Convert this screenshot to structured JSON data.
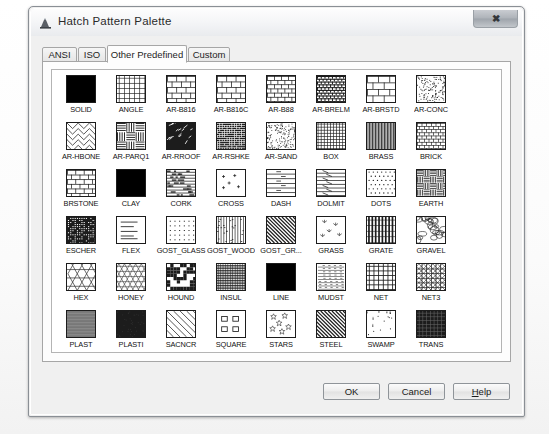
{
  "window": {
    "title": "Hatch Pattern Palette",
    "icon": "autocad-hatch-icon",
    "close_label": "✖"
  },
  "tabs": [
    {
      "label": "ANSI",
      "selected": false
    },
    {
      "label": "ISO",
      "selected": false
    },
    {
      "label": "Other Predefined",
      "selected": true
    },
    {
      "label": "Custom",
      "selected": false
    }
  ],
  "patterns": [
    {
      "label": "SOLID",
      "fill": "solid"
    },
    {
      "label": "ANGLE",
      "fill": "angle"
    },
    {
      "label": "AR-B816",
      "fill": "brick-lg"
    },
    {
      "label": "AR-B816C",
      "fill": "brick-lg"
    },
    {
      "label": "AR-B88",
      "fill": "brick-sm"
    },
    {
      "label": "AR-BRELM",
      "fill": "brick-dense-dark"
    },
    {
      "label": "AR-BRSTD",
      "fill": "brick-wide"
    },
    {
      "label": "AR-CONC",
      "fill": "concrete"
    },
    {
      "label": "AR-HBONE",
      "fill": "herringbone"
    },
    {
      "label": "AR-PARQ1",
      "fill": "parquet"
    },
    {
      "label": "AR-RROOF",
      "fill": "rroof"
    },
    {
      "label": "AR-RSHKE",
      "fill": "rshake"
    },
    {
      "label": "AR-SAND",
      "fill": "sand"
    },
    {
      "label": "BOX",
      "fill": "box"
    },
    {
      "label": "BRASS",
      "fill": "brass"
    },
    {
      "label": "BRICK",
      "fill": "brick-tiny"
    },
    {
      "label": "BRSTONE",
      "fill": "brick-stone"
    },
    {
      "label": "CLAY",
      "fill": "solid"
    },
    {
      "label": "CORK",
      "fill": "cork"
    },
    {
      "label": "CROSS",
      "fill": "cross"
    },
    {
      "label": "DASH",
      "fill": "dash"
    },
    {
      "label": "DOLMIT",
      "fill": "dolmit"
    },
    {
      "label": "DOTS",
      "fill": "dots"
    },
    {
      "label": "EARTH",
      "fill": "earth"
    },
    {
      "label": "ESCHER",
      "fill": "escher"
    },
    {
      "label": "FLEX",
      "fill": "flex"
    },
    {
      "label": "GOST_GLASS",
      "fill": "gost-glass"
    },
    {
      "label": "GOST_WOOD",
      "fill": "gost-wood"
    },
    {
      "label": "GOST_GR...",
      "fill": "diag45"
    },
    {
      "label": "GRASS",
      "fill": "grass"
    },
    {
      "label": "GRATE",
      "fill": "grate"
    },
    {
      "label": "GRAVEL",
      "fill": "gravel"
    },
    {
      "label": "HEX",
      "fill": "hex"
    },
    {
      "label": "HONEY",
      "fill": "honey"
    },
    {
      "label": "HOUND",
      "fill": "hound"
    },
    {
      "label": "INSUL",
      "fill": "insul"
    },
    {
      "label": "LINE",
      "fill": "solid"
    },
    {
      "label": "MUDST",
      "fill": "mudst"
    },
    {
      "label": "NET",
      "fill": "net"
    },
    {
      "label": "NET3",
      "fill": "net3"
    },
    {
      "label": "PLAST",
      "fill": "plast"
    },
    {
      "label": "PLASTI",
      "fill": "plasti"
    },
    {
      "label": "SACNCR",
      "fill": "sacncr"
    },
    {
      "label": "SQUARE",
      "fill": "square"
    },
    {
      "label": "STARS",
      "fill": "stars"
    },
    {
      "label": "STEEL",
      "fill": "diag45"
    },
    {
      "label": "SWAMP",
      "fill": "swamp"
    },
    {
      "label": "TRANS",
      "fill": "trans"
    },
    {
      "label": "TRIANG",
      "fill": "triang"
    },
    {
      "label": "ZIGZAG",
      "fill": "zigzag"
    }
  ],
  "buttons": {
    "ok": "OK",
    "cancel": "Cancel",
    "help_pre": "H",
    "help_post": "elp"
  },
  "colors": {
    "dialog_face": "#f0f0f0",
    "list_bg": "#ffffff",
    "swatch_ink": "#1c1c1c",
    "text": "#111111",
    "border": "#a6a6a6"
  }
}
